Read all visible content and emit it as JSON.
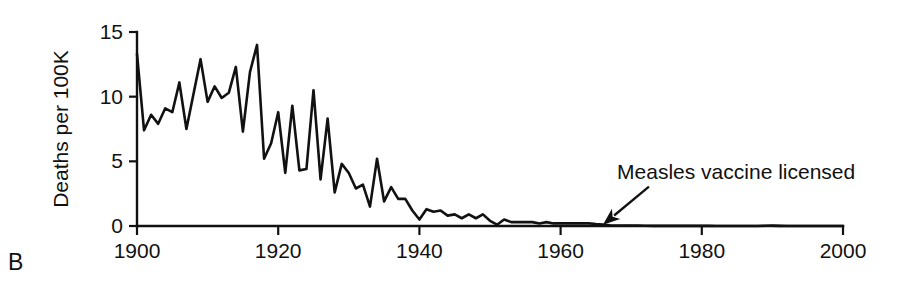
{
  "panel": {
    "label": "B"
  },
  "chart_data": {
    "type": "line",
    "title": "",
    "xlabel": "",
    "ylabel": "Deaths per 100K",
    "xlim": [
      1900,
      2000
    ],
    "ylim": [
      0,
      15
    ],
    "xticks": [
      1900,
      1920,
      1940,
      1960,
      1980,
      2000
    ],
    "xtick_labels": [
      "1900",
      "1920",
      "1940",
      "1960",
      "1980",
      "2000"
    ],
    "yticks": [
      0,
      5,
      10,
      15
    ],
    "ytick_labels": [
      "0",
      "5",
      "10",
      "15"
    ],
    "grid": false,
    "legend": null,
    "legend_position": "none",
    "series": [
      {
        "name": "Measles deaths per 100,000 population",
        "x": [
          1900,
          1901,
          1902,
          1903,
          1904,
          1905,
          1906,
          1907,
          1908,
          1909,
          1910,
          1911,
          1912,
          1913,
          1914,
          1915,
          1916,
          1917,
          1918,
          1919,
          1920,
          1921,
          1922,
          1923,
          1924,
          1925,
          1926,
          1927,
          1928,
          1929,
          1930,
          1931,
          1932,
          1933,
          1934,
          1935,
          1936,
          1937,
          1938,
          1939,
          1940,
          1941,
          1942,
          1943,
          1944,
          1945,
          1946,
          1947,
          1948,
          1949,
          1950,
          1951,
          1952,
          1953,
          1954,
          1955,
          1956,
          1957,
          1958,
          1959,
          1960,
          1961,
          1962,
          1963,
          1964,
          1965,
          1966,
          1967,
          1968,
          1969,
          1970,
          1971,
          1972,
          1973,
          1974,
          1975,
          1976,
          1977,
          1978,
          1979,
          1980,
          1981,
          1982,
          1983,
          1984,
          1985,
          1986,
          1987,
          1988,
          1989,
          1990,
          1991,
          1992,
          1993,
          1994,
          1995,
          1996,
          1997,
          1998,
          1999,
          2000
        ],
        "values": [
          13.3,
          7.4,
          8.6,
          7.9,
          9.1,
          8.8,
          11.1,
          7.5,
          10.2,
          12.9,
          9.6,
          10.8,
          9.9,
          10.3,
          12.3,
          7.3,
          11.9,
          14.0,
          5.2,
          6.4,
          8.8,
          4.1,
          9.3,
          4.3,
          4.4,
          10.5,
          3.6,
          8.3,
          2.6,
          4.8,
          4.1,
          2.9,
          3.2,
          1.5,
          5.2,
          1.9,
          3.0,
          2.1,
          2.1,
          1.2,
          0.5,
          1.3,
          1.1,
          1.2,
          0.8,
          0.9,
          0.6,
          0.9,
          0.6,
          0.9,
          0.4,
          0.1,
          0.5,
          0.3,
          0.3,
          0.3,
          0.3,
          0.2,
          0.3,
          0.2,
          0.2,
          0.2,
          0.2,
          0.2,
          0.2,
          0.15,
          0.12,
          0.05,
          0.04,
          0.03,
          0.03,
          0.03,
          0.02,
          0.01,
          0.01,
          0.01,
          0.01,
          0.01,
          0.01,
          0.01,
          0.01,
          0.01,
          0.0,
          0.0,
          0.0,
          0.0,
          0.0,
          0.0,
          0.0,
          0.02,
          0.03,
          0.01,
          0.0,
          0.0,
          0.0,
          0.0,
          0.0,
          0.0,
          0.0,
          0.0,
          0.0
        ]
      }
    ],
    "annotations": [
      {
        "text": "Measles vaccine licensed",
        "point_x": 1966,
        "point_y": 0.1,
        "label_x": 1968,
        "label_y": 3.6
      }
    ]
  }
}
